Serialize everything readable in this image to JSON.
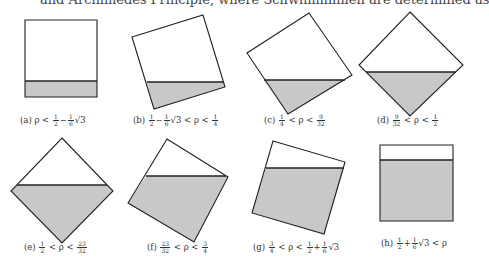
{
  "header": {
    "clipped_text": "and Archimedes Principle, where Schwimmlinien are determined as"
  },
  "figure": {
    "panels": [
      {
        "id": "a",
        "caption": "(a) ρ < ½ − ⅙√3",
        "caption_label": "(a)",
        "caption_math": "ρ < 1/2 − 1/6 √3",
        "outline": "25,20 97,20 97,97 25,97",
        "water": "25,81 97,81 97,97 25,97",
        "waterline": [
          25,
          81,
          97,
          81
        ],
        "caption_pos": [
          20,
          118
        ]
      },
      {
        "id": "b",
        "caption": "(b) ½ − ⅙√3 < ρ < ¼",
        "caption_label": "(b)",
        "caption_math": "1/2 − 1/6 √3 < ρ < 1/4",
        "outline": "132,37 203,15 225,87 154,109",
        "water": "147,82 224,82 225,87 154,109",
        "waterline": [
          147,
          82,
          224,
          82
        ],
        "caption_pos": [
          133,
          118
        ]
      },
      {
        "id": "c",
        "caption": "(c) ¼ < ρ < 9/32",
        "caption_label": "(c)",
        "caption_math": "1/4 < ρ < 9/32",
        "outline": "309,13 352,75 288,114 247,53",
        "water": "264,80 345,80 288,114",
        "waterline": [
          264,
          80,
          345,
          80
        ],
        "caption_pos": [
          264,
          118
        ]
      },
      {
        "id": "d",
        "caption": "(d) 9/32 < ρ < ½",
        "caption_label": "(d)",
        "caption_math": "9/32 < ρ < 1/2",
        "outline": "410,12 463,65 410,116 359,65",
        "water": "366,72 456,72 410,116",
        "waterline": [
          366,
          72,
          456,
          72
        ],
        "caption_pos": [
          377,
          118
        ]
      },
      {
        "id": "e",
        "caption": "(e) ½ < ρ < 23/32",
        "caption_label": "(e)",
        "caption_math": "1/2 < ρ < 23/32",
        "outline": "62,138 113,191 62,243 11,191",
        "water": "17,185 107,185 113,191 62,243 11,191",
        "waterline": [
          17,
          185,
          107,
          185
        ],
        "caption_pos": [
          24,
          244
        ]
      },
      {
        "id": "f",
        "caption": "(f) 23/32 < ρ < ¾",
        "caption_label": "(f)",
        "caption_math": "23/32 < ρ < 3/4",
        "outline": "167,139 228,177 194,242 128,203",
        "water": "146,176 226,176 228,177 194,242 128,203",
        "waterline": [
          146,
          176,
          226,
          176
        ],
        "caption_pos": [
          147,
          244
        ]
      },
      {
        "id": "g",
        "caption": "(g) ¾ < ρ < ½ + ⅙√3",
        "caption_label": "(g)",
        "caption_math": "3/4 < ρ < 1/2 + 1/6 √3",
        "outline": "273,141 345,162 324,234 252,213",
        "water": "266,168 344,168 324,234 252,213",
        "waterline": [
          266,
          168,
          344,
          168
        ],
        "caption_pos": [
          254,
          244
        ]
      },
      {
        "id": "h",
        "caption": "(h) ½ + ⅙√3 < ρ",
        "caption_label": "(h)",
        "caption_math": "1/2 + 1/6 √3 < ρ",
        "outline": "380,145 453,145 453,221 380,221",
        "water": "380,160 453,160 453,221 380,221",
        "waterline": [
          380,
          160,
          453,
          160
        ],
        "caption_pos": [
          382,
          237
        ]
      }
    ],
    "colors": {
      "water_fill": "#c8c8c8",
      "outline": "#222222",
      "background": "#ffffff"
    }
  }
}
